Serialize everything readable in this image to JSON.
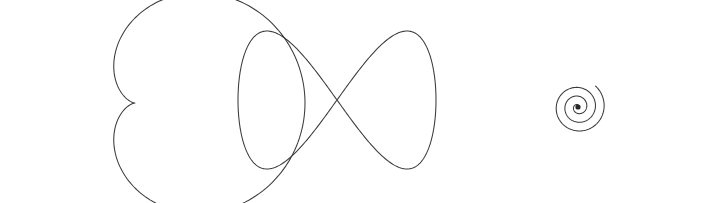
{
  "figure": {
    "background_color": "#ffffff",
    "stroke_color": "#3a3a3c",
    "stroke_width": 1.05,
    "width": 713,
    "height": 203,
    "panel_count": 3
  },
  "panels": [
    {
      "id": "cardioid",
      "name": "Cardioid",
      "caption": "",
      "curve_type": "cardioid",
      "equation": "r = a(1 - cos(theta))",
      "cusp_direction": "left",
      "cusp_point": [
        50,
        105
      ],
      "bounds": {
        "x_min": 29,
        "x_max": 195,
        "y_min": 18,
        "y_max": 188
      },
      "center": [
        118,
        103
      ],
      "closed": true
    },
    {
      "id": "lemniscate",
      "name": "Figure-eight curve",
      "caption": "",
      "curve_type": "lemniscate",
      "equation": "x = a sin(t), y = b sin(2t)",
      "crossing_point": [
        337,
        100
      ],
      "lobes": 2,
      "lobe_peaks": [
        [
          265,
          33
        ],
        [
          400,
          33
        ]
      ],
      "lobe_valleys": [
        [
          272,
          169
        ],
        [
          405,
          169
        ]
      ],
      "bounds": {
        "x_min": 238,
        "x_max": 435,
        "y_min": 32,
        "y_max": 170
      },
      "center": [
        337,
        100
      ],
      "closed": true
    },
    {
      "id": "spiral",
      "name": "Archimedean spiral",
      "caption": "",
      "curve_type": "spiral",
      "equation": "r = a*theta",
      "turns": 3.1,
      "winding": "counterclockwise",
      "center": [
        578,
        107
      ],
      "core_dot_radius": 2.6,
      "free_end": [
        682,
        110
      ],
      "bounds": {
        "x_min": 503,
        "x_max": 682,
        "y_min": 25,
        "y_max": 175
      },
      "closed": false
    }
  ],
  "chart_data": {
    "type": "line",
    "xlabel": "",
    "ylabel": "",
    "grid": false,
    "legend": "none",
    "axes_visible": false,
    "tick_labels": [],
    "series": [
      {
        "name": "Cardioid",
        "curve": "cardioid",
        "polar_equation": "r = a(1 - cos(theta))",
        "parameters": {
          "a": 85,
          "cx": 135,
          "cy": 103
        },
        "theta_range_deg": [
          0,
          360
        ],
        "sample_count": 240
      },
      {
        "name": "Figure-eight",
        "curve": "lemniscate",
        "parametric_equation": "x = cx + A*sin(t), y = cy + B*sin(2t)",
        "parameters": {
          "A": 99,
          "B": 69,
          "cx": 337,
          "cy": 100
        },
        "t_range_deg": [
          0,
          360
        ],
        "sample_count": 360
      },
      {
        "name": "Archimedean spiral",
        "curve": "spiral",
        "polar_equation": "r = k*theta",
        "parameters": {
          "k": 4.35,
          "cx": 578,
          "cy": 107,
          "theta_max_deg": 1130
        },
        "sample_count": 600
      }
    ]
  }
}
